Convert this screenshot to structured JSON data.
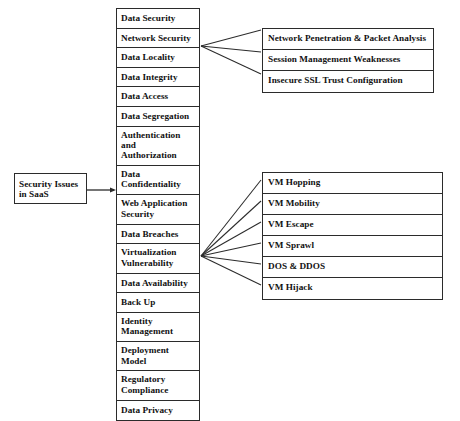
{
  "diagram": {
    "root": {
      "line1": "Security Issues",
      "line2": "in SaaS"
    },
    "main_column": [
      {
        "lines": [
          "Data Security"
        ]
      },
      {
        "lines": [
          "Network Security"
        ]
      },
      {
        "lines": [
          "Data Locality"
        ]
      },
      {
        "lines": [
          "Data Integrity"
        ]
      },
      {
        "lines": [
          "Data Access"
        ]
      },
      {
        "lines": [
          "Data Segregation"
        ]
      },
      {
        "lines": [
          "Authentication",
          "and",
          "Authorization"
        ]
      },
      {
        "lines": [
          "Data",
          "Confidentiality"
        ]
      },
      {
        "lines": [
          "Web Application",
          "Security"
        ]
      },
      {
        "lines": [
          "Data Breaches"
        ]
      },
      {
        "lines": [
          "Virtualization",
          "Vulnerability"
        ]
      },
      {
        "lines": [
          "Data Availability"
        ]
      },
      {
        "lines": [
          "Back Up"
        ]
      },
      {
        "lines": [
          "Identity",
          "Management"
        ]
      },
      {
        "lines": [
          "Deployment",
          "Model"
        ]
      },
      {
        "lines": [
          "Regulatory",
          "Compliance"
        ]
      },
      {
        "lines": [
          "Data Privacy"
        ]
      }
    ],
    "network_security_children": [
      "Network Penetration & Packet Analysis",
      "Session Management Weaknesses",
      "Insecure SSL Trust Configuration"
    ],
    "virtualization_children": [
      "VM Hopping",
      "VM Mobility",
      "VM Escape",
      "VM Sprawl",
      "DOS & DDOS",
      "VM Hijack"
    ],
    "colors": {
      "stroke": "#2b2b2b",
      "text": "#111111",
      "background": "#ffffff"
    }
  }
}
